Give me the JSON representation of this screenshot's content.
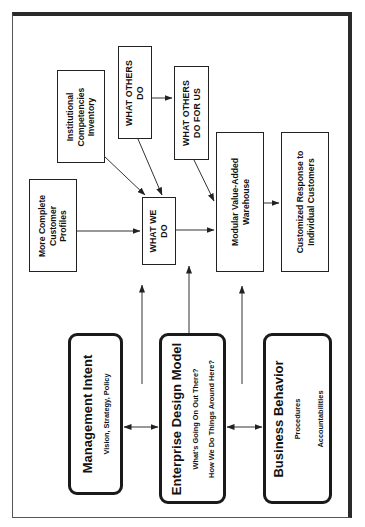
{
  "diagram": {
    "orientation": "rotated -90deg (landscape figure printed on portrait page)",
    "colors": {
      "line": "#222222",
      "background": "#ffffff",
      "frame": "#2a2a2a"
    },
    "boxes": {
      "institutional": {
        "lines": [
          "Institutional",
          "Competencies",
          "Inventory"
        ]
      },
      "what_others_do": {
        "lines": [
          "WHAT OTHERS",
          "DO"
        ]
      },
      "what_others_do_for_us": {
        "lines": [
          "WHAT OTHERS",
          "DO FOR US"
        ]
      },
      "customer_profiles": {
        "lines": [
          "More Complete",
          "Customer",
          "Profiles"
        ]
      },
      "what_we_do": {
        "lines": [
          "WHAT WE",
          "DO"
        ]
      },
      "warehouse": {
        "lines": [
          "Modular Value-Added",
          "Warehouse"
        ]
      },
      "customized_response": {
        "lines": [
          "Customized Response to",
          "Individual Customers"
        ]
      }
    },
    "rounded_boxes": {
      "management_intent": {
        "title": "Management Intent",
        "subs": [
          "Vision, Strategy, Policy"
        ]
      },
      "enterprise_design_model": {
        "title": "Enterprise Design Model",
        "subs": [
          "What's Going On Out There?",
          "How We Do Things Around Here?"
        ]
      },
      "business_behavior": {
        "title": "Business Behavior",
        "subs": [
          "Procedures",
          "Accountabilities"
        ]
      }
    },
    "connections": [
      {
        "from": "Institutional Competencies Inventory",
        "to": "WHAT WE DO",
        "type": "arrow"
      },
      {
        "from": "WHAT OTHERS DO",
        "to": "WHAT WE DO",
        "type": "arrow"
      },
      {
        "from": "WHAT OTHERS DO",
        "to": "WHAT OTHERS DO FOR US",
        "type": "arrow"
      },
      {
        "from": "WHAT OTHERS DO FOR US",
        "to": "Modular Value-Added Warehouse",
        "type": "arrow"
      },
      {
        "from": "More Complete Customer Profiles",
        "to": "WHAT WE DO",
        "type": "arrow"
      },
      {
        "from": "WHAT WE DO",
        "to": "Modular Value-Added Warehouse",
        "type": "arrow"
      },
      {
        "from": "Modular Value-Added Warehouse",
        "to": "Customized Response to Individual Customers",
        "type": "arrow"
      },
      {
        "from": "Management Intent",
        "to": "WHAT WE DO",
        "type": "arrow"
      },
      {
        "from": "Enterprise Design Model",
        "to": "WHAT WE DO",
        "type": "arrow"
      },
      {
        "from": "Business Behavior",
        "to": "Modular Value-Added Warehouse",
        "type": "arrow"
      },
      {
        "from": "Management Intent",
        "to": "Enterprise Design Model",
        "type": "bidirectional"
      },
      {
        "from": "Enterprise Design Model",
        "to": "Business Behavior",
        "type": "bidirectional"
      }
    ]
  }
}
